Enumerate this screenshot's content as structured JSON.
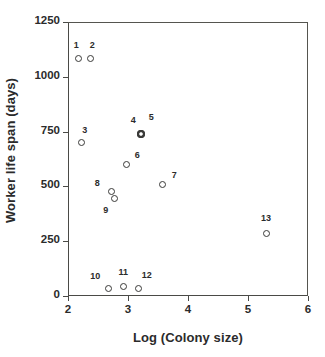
{
  "chart_data": {
    "type": "scatter",
    "title": "",
    "xlabel": "Log (Colony size)",
    "ylabel": "Worker life span (days)",
    "xlim": [
      2,
      6
    ],
    "ylim": [
      0,
      1250
    ],
    "xticks": [
      "2",
      "3",
      "4",
      "5",
      "6"
    ],
    "xtick_values": [
      2,
      3,
      4,
      5,
      6
    ],
    "yticks": [
      "0",
      "250",
      "500",
      "750",
      "1000",
      "1250"
    ],
    "ytick_values": [
      0,
      250,
      500,
      750,
      1000,
      1250
    ],
    "grid": false,
    "legend": null,
    "marker": "open-circle",
    "points": [
      {
        "label": "1",
        "x": 2.17,
        "y": 1085,
        "label_dx": -2,
        "label_dy": -13,
        "emphasis": false
      },
      {
        "label": "2",
        "x": 2.37,
        "y": 1085,
        "label_dx": 2,
        "label_dy": -13,
        "emphasis": false
      },
      {
        "label": "3",
        "x": 2.23,
        "y": 698,
        "label_dx": 3,
        "label_dy": -13,
        "emphasis": false
      },
      {
        "label": "4",
        "x": 3.22,
        "y": 739,
        "label_dx": -8,
        "label_dy": -14,
        "emphasis": true
      },
      {
        "label": "5",
        "x": 3.22,
        "y": 739,
        "label_dx": 10,
        "label_dy": -17,
        "emphasis": true
      },
      {
        "label": "6",
        "x": 2.97,
        "y": 602,
        "label_dx": 11,
        "label_dy": -9,
        "emphasis": false
      },
      {
        "label": "7",
        "x": 3.57,
        "y": 507,
        "label_dx": 12,
        "label_dy": -10,
        "emphasis": false
      },
      {
        "label": "8",
        "x": 2.72,
        "y": 475,
        "label_dx": -14,
        "label_dy": -9,
        "emphasis": false
      },
      {
        "label": "9",
        "x": 2.78,
        "y": 443,
        "label_dx": -9,
        "label_dy": 11,
        "emphasis": false
      },
      {
        "label": "10",
        "x": 2.67,
        "y": 36,
        "label_dx": -13,
        "label_dy": -12,
        "emphasis": false
      },
      {
        "label": "11",
        "x": 2.92,
        "y": 45,
        "label_dx": 0,
        "label_dy": -14,
        "emphasis": false
      },
      {
        "label": "12",
        "x": 3.18,
        "y": 36,
        "label_dx": 8,
        "label_dy": -13,
        "emphasis": false
      },
      {
        "label": "13",
        "x": 5.3,
        "y": 287,
        "label_dx": 0,
        "label_dy": -15,
        "emphasis": false
      }
    ]
  }
}
